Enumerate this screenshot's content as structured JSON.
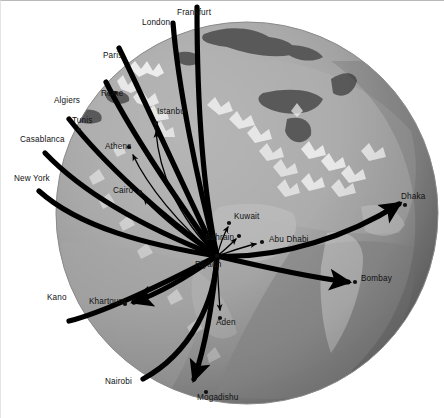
{
  "figure": {
    "background_color": "#ffffff",
    "globe": {
      "center_x": 246,
      "center_y": 212,
      "radius": 191,
      "ocean_color": "#9d9d9d",
      "land_light_color": "#b3b3b3",
      "land_highlight_color": "#efefef",
      "sea_dark_color": "#5e5e5e",
      "shadow_color": "#6f6f6f"
    },
    "route_color": "#000000",
    "dot_color": "#101010",
    "hub": "Riyadh"
  },
  "chart_data": {
    "type": "map",
    "hub": {
      "name": "Riyadh",
      "x": 216,
      "y": 255
    },
    "destinations": [
      {
        "name": "Frankfurt",
        "label_x": 176,
        "label_y": 14,
        "dot": false,
        "thick": true
      },
      {
        "name": "London",
        "label_x": 141,
        "label_y": 24,
        "dot": false,
        "thick": true
      },
      {
        "name": "Paris",
        "label_x": 102,
        "label_y": 57,
        "dot": false,
        "thick": true
      },
      {
        "name": "Rome",
        "label_x": 100,
        "label_y": 95,
        "dot": true,
        "dot_x": 114,
        "dot_y": 92,
        "thick": true
      },
      {
        "name": "Algiers",
        "label_x": 53,
        "label_y": 102,
        "dot": false,
        "thick": true
      },
      {
        "name": "Tunis",
        "label_x": 71,
        "label_y": 122,
        "dot": true,
        "dot_x": 78,
        "dot_y": 129,
        "thick": true
      },
      {
        "name": "Casablanca",
        "label_x": 19,
        "label_y": 141,
        "dot": false,
        "thick": true
      },
      {
        "name": "New York",
        "label_x": 13,
        "label_y": 180,
        "dot": false,
        "thick": true
      },
      {
        "name": "Istanbul",
        "label_x": 156,
        "label_y": 113,
        "dot": true,
        "dot_x": 155,
        "dot_y": 122,
        "thick": false
      },
      {
        "name": "Athens",
        "label_x": 104,
        "label_y": 148,
        "dot": true,
        "dot_x": 128,
        "dot_y": 146,
        "thick": false
      },
      {
        "name": "Cairo",
        "label_x": 112,
        "label_y": 192,
        "dot": true,
        "dot_x": 139,
        "dot_y": 191,
        "thick": false
      },
      {
        "name": "Kuwait",
        "label_x": 233,
        "label_y": 218,
        "dot": true,
        "dot_x": 228,
        "dot_y": 222,
        "thick": false
      },
      {
        "name": "Bahrain",
        "label_x": 204,
        "label_y": 239,
        "dot": true,
        "dot_x": 238,
        "dot_y": 235,
        "thick": false
      },
      {
        "name": "Abu Dhabi",
        "label_x": 268,
        "label_y": 241,
        "dot": true,
        "dot_x": 261,
        "dot_y": 241,
        "thick": false
      },
      {
        "name": "Dhaka",
        "label_x": 400,
        "label_y": 198,
        "dot": true,
        "dot_x": 404,
        "dot_y": 204,
        "thick": true
      },
      {
        "name": "Bombay",
        "label_x": 360,
        "label_y": 280,
        "dot": true,
        "dot_x": 354,
        "dot_y": 281,
        "thick": true
      },
      {
        "name": "Khartoum",
        "label_x": 88,
        "label_y": 303,
        "dot": true,
        "dot_x": 124,
        "dot_y": 303,
        "thick": true
      },
      {
        "name": "Kano",
        "label_x": 46,
        "label_y": 299,
        "dot": false,
        "thick": true
      },
      {
        "name": "Aden",
        "label_x": 215,
        "label_y": 324,
        "dot": true,
        "dot_x": 219,
        "dot_y": 317,
        "thick": false
      },
      {
        "name": "Nairobi",
        "label_x": 104,
        "label_y": 383,
        "dot": false,
        "thick": true
      },
      {
        "name": "Mogadishu",
        "label_x": 196,
        "label_y": 399,
        "dot": true,
        "dot_x": 205,
        "dot_y": 391,
        "thick": true
      }
    ],
    "routes": [
      {
        "to": "Frankfurt",
        "path": "M216 255 C 200 180, 196 80, 196 6",
        "thick": true,
        "arrow": false
      },
      {
        "to": "London",
        "path": "M216 255 C 196 180, 177 84, 172 22",
        "thick": true,
        "arrow": false
      },
      {
        "to": "Paris",
        "path": "M216 255 C 180 180, 140 92, 118 47",
        "thick": true,
        "arrow": false
      },
      {
        "to": "Rome",
        "path": "M216 255 C 174 196, 130 132, 105 81",
        "thick": true,
        "arrow": false
      },
      {
        "to": "Tunis",
        "path": "M216 255 C 162 216, 104 164, 68 118",
        "thick": true,
        "arrow": false
      },
      {
        "to": "Casablanca",
        "path": "M216 255 C 152 230, 86 196, 44 152",
        "thick": true,
        "arrow": false
      },
      {
        "to": "NewYork",
        "path": "M216 255 C 146 244, 78 226, 38 190",
        "thick": true,
        "arrow": false
      },
      {
        "to": "Istanbul",
        "path": "M216 255 C 175 215, 158 168, 155 131",
        "thick": false,
        "arrow": true
      },
      {
        "to": "Athens",
        "path": "M216 255 C 178 224, 146 184, 132 154",
        "thick": false,
        "arrow": true
      },
      {
        "to": "Cairo",
        "path": "M216 255 C 188 240, 158 214, 143 198",
        "thick": false,
        "arrow": true
      },
      {
        "to": "Kuwait",
        "path": "M216 255 C 219 244, 223 233, 227 226",
        "thick": false,
        "arrow": true
      },
      {
        "to": "Bahrain",
        "path": "M216 255 C 224 249, 230 243, 235 238",
        "thick": false,
        "arrow": true
      },
      {
        "to": "AbuDhabi",
        "path": "M216 255 C 231 250, 244 245, 255 243",
        "thick": false,
        "arrow": true
      },
      {
        "to": "Dhaka",
        "path": "M216 255 C 280 258, 350 234, 398 203",
        "thick": true,
        "arrow": true
      },
      {
        "to": "Bombay",
        "path": "M216 255 C 262 266, 308 276, 347 281",
        "thick": true,
        "arrow": true
      },
      {
        "to": "Khartoum",
        "path": "M216 255 C 192 272, 160 292, 133 301",
        "thick": true,
        "arrow": true
      },
      {
        "to": "Kano",
        "path": "M216 255 C 168 280, 108 310, 68 320",
        "thick": true,
        "arrow": false
      },
      {
        "to": "Nairobi",
        "path": "M216 255 C 214 300, 190 352, 142 378",
        "thick": true,
        "arrow": false
      },
      {
        "to": "Aden",
        "path": "M216 255 C 217 278, 218 296, 219 309",
        "thick": false,
        "arrow": true
      },
      {
        "to": "Mogadishu",
        "path": "M216 255 C 212 300, 204 346, 193 378",
        "thick": true,
        "arrow": true
      }
    ]
  }
}
